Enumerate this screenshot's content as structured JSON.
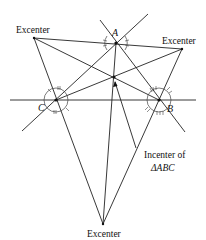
{
  "diagram": {
    "vertices": [
      {
        "id": "A",
        "label": "A"
      },
      {
        "id": "B",
        "label": "B"
      },
      {
        "id": "C",
        "label": "C"
      }
    ],
    "excenter_labels": [
      "Excenter",
      "Excenter",
      "Excenter"
    ],
    "incenter_label_line1": "Incenter of",
    "incenter_label_line2": "ΔABC"
  }
}
